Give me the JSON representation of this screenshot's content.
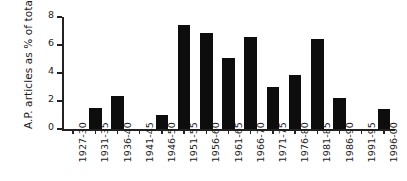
{
  "chart_data": {
    "type": "bar",
    "title": "",
    "xlabel": "",
    "ylabel": "A.P. articles as % of total",
    "ylim": [
      0,
      8
    ],
    "yticks": [
      0,
      2,
      4,
      6,
      8
    ],
    "ytick_labels": [
      "0",
      "2",
      "4",
      "6",
      "8"
    ],
    "grid": false,
    "legend": null,
    "bar_color": "#0d0d0d",
    "axis_color": "#222222",
    "categories": [
      "1927-30",
      "1931-35",
      "1936-40",
      "1941-45",
      "1946-50",
      "1951-55",
      "1956-60",
      "1961-65",
      "1966-70",
      "1971-75",
      "1976-80",
      "1981-85",
      "1986-90",
      "1991-95",
      "1996-00"
    ],
    "values": [
      0,
      1.5,
      2.35,
      0,
      1.0,
      7.45,
      6.85,
      5.05,
      6.6,
      3.0,
      3.85,
      6.4,
      2.2,
      0,
      1.45
    ]
  }
}
